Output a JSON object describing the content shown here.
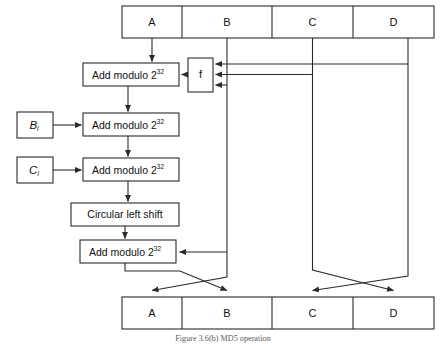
{
  "figure": {
    "caption": "Figure 3.6(b)   MD5 operation",
    "title": "MD5 operation"
  },
  "colors": {
    "stroke": "#2b2b2b",
    "background": "#ffffff",
    "text": "#111111",
    "caption_text": "#5d5d5d"
  },
  "top_register": {
    "name": "input-register-row",
    "cells": [
      {
        "label": "A"
      },
      {
        "label": "B"
      },
      {
        "label": "C"
      },
      {
        "label": "D"
      }
    ]
  },
  "bottom_register": {
    "name": "output-register-row",
    "cells": [
      {
        "label": "A"
      },
      {
        "label": "B"
      },
      {
        "label": "C"
      },
      {
        "label": "D"
      }
    ]
  },
  "operations": [
    {
      "id": "add1",
      "label": "Add modulo 2",
      "exponent": "32"
    },
    {
      "id": "add2",
      "label": "Add modulo 2",
      "exponent": "32"
    },
    {
      "id": "add3",
      "label": "Add modulo 2",
      "exponent": "32"
    },
    {
      "id": "shift",
      "label": "Circular left shift",
      "exponent": ""
    },
    {
      "id": "add4",
      "label": "Add modulo 2",
      "exponent": "32"
    }
  ],
  "function_box": {
    "label": "f",
    "name": "nonlinear-function-box",
    "input_count": 3
  },
  "inputs": [
    {
      "id": "Bi",
      "base": "B",
      "subscript": "i"
    },
    {
      "id": "Ci",
      "base": "C",
      "subscript": "i"
    }
  ],
  "icons": {
    "arrowhead": "arrowhead-icon"
  }
}
